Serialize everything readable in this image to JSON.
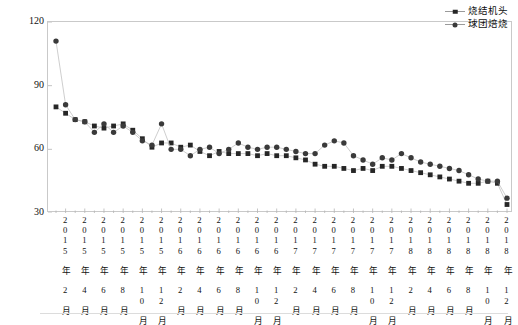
{
  "figure": {
    "y_axis_title": "SO₂排放浓度/（mg/m³）",
    "y_ticks": [
      "120",
      "90",
      "60",
      "30"
    ],
    "legend": [
      {
        "label": "烧结机头",
        "marker": "square",
        "color": "#262626"
      },
      {
        "label": "球团焙烧",
        "marker": "circle",
        "color": "#3a3a3a"
      }
    ],
    "x_tick_labels": [
      "2015 年 2 月",
      "2015 年 4 月",
      "2015 年 6 月",
      "2015 年 8 月",
      "2015 年 10 月",
      "2015 年 12 月",
      "2016 年 2 月",
      "2016 年 4 月",
      "2016 年 6 月",
      "2016 年 8 月",
      "2016 年 10 月",
      "2016 年 12 月",
      "2017 年 2 月",
      "2017 年 4 月",
      "2017 年 6 月",
      "2017 年 8 月",
      "2017 年 10 月",
      "2017 年 12 月",
      "2018 年 2 月",
      "2018 年 4 月",
      "2018 年 6 月",
      "2018 年 8 月",
      "2018 年 10 月",
      "2018 年 12 月"
    ]
  },
  "chart_data": {
    "type": "line",
    "title": "",
    "xlabel": "",
    "ylabel": "SO₂排放浓度/（mg/m³）",
    "ylim": [
      30,
      120
    ],
    "yticks": [
      30,
      60,
      90,
      120
    ],
    "grid": false,
    "legend_position": "top-right",
    "x": [
      "2015-01",
      "2015-02",
      "2015-03",
      "2015-04",
      "2015-05",
      "2015-06",
      "2015-07",
      "2015-08",
      "2015-09",
      "2015-10",
      "2015-11",
      "2015-12",
      "2016-01",
      "2016-02",
      "2016-03",
      "2016-04",
      "2016-05",
      "2016-06",
      "2016-07",
      "2016-08",
      "2016-09",
      "2016-10",
      "2016-11",
      "2016-12",
      "2017-01",
      "2017-02",
      "2017-03",
      "2017-04",
      "2017-05",
      "2017-06",
      "2017-07",
      "2017-08",
      "2017-09",
      "2017-10",
      "2017-11",
      "2017-12",
      "2018-01",
      "2018-02",
      "2018-03",
      "2018-04",
      "2018-05",
      "2018-06",
      "2018-07",
      "2018-08",
      "2018-09",
      "2018-10",
      "2018-11",
      "2018-12"
    ],
    "series": [
      {
        "name": "烧结机头",
        "marker": "square",
        "color": "#262626",
        "values": [
          80,
          77,
          74,
          73,
          71,
          70,
          71,
          72,
          69,
          65,
          61,
          63,
          63,
          61,
          62,
          59,
          57,
          59,
          58,
          58,
          58,
          57,
          58,
          57,
          57,
          56,
          55,
          53,
          52,
          52,
          51,
          50,
          51,
          50,
          52,
          52,
          51,
          50,
          49,
          48,
          47,
          46,
          45,
          44,
          44,
          45,
          44,
          34
        ]
      },
      {
        "name": "球团焙烧",
        "marker": "circle",
        "color": "#3a3a3a",
        "values": [
          111,
          81,
          74,
          73,
          68,
          72,
          68,
          71,
          68,
          64,
          62,
          72,
          60,
          60,
          57,
          60,
          61,
          58,
          60,
          63,
          61,
          60,
          61,
          61,
          60,
          59,
          58,
          58,
          62,
          64,
          63,
          57,
          55,
          53,
          56,
          55,
          58,
          56,
          54,
          53,
          52,
          51,
          50,
          48,
          46,
          45,
          45,
          37
        ]
      }
    ]
  }
}
